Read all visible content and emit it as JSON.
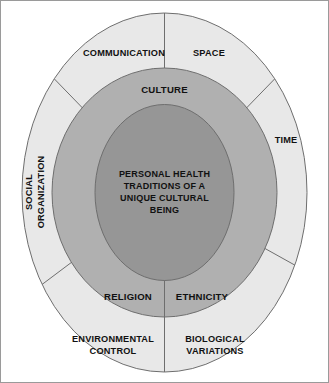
{
  "diagram": {
    "title": "Personal Health Traditions of a Unique Cultural Being",
    "type": "concentric-ellipse-model",
    "colors": {
      "background": "#ffffff",
      "outer_ring": "#e8e8e8",
      "middle_ring": "#b0b0b0",
      "inner_core": "#969696",
      "stroke": "#6e6e6e",
      "text": "#111111",
      "frame": "#9a9a9a"
    },
    "core": {
      "name": "core-ellipse",
      "lines": [
        "PERSONAL HEALTH",
        "TRADITIONS OF A",
        "UNIQUE CULTURAL",
        "BEING"
      ]
    },
    "middle_ring": {
      "name": "middle-ring",
      "labels": [
        {
          "id": "culture",
          "text": "CULTURE",
          "position": "top"
        },
        {
          "id": "religion",
          "text": "RELIGION",
          "position": "bottom-left"
        },
        {
          "id": "ethnicity",
          "text": "ETHNICITY",
          "position": "bottom-right"
        }
      ]
    },
    "outer_ring": {
      "name": "outer-ring",
      "labels": [
        {
          "id": "communication",
          "text": "COMMUNICATION",
          "lines": [
            "COMMUNICATION"
          ],
          "position": "top-left",
          "rotated": false
        },
        {
          "id": "space",
          "text": "SPACE",
          "lines": [
            "SPACE"
          ],
          "position": "top-right",
          "rotated": false
        },
        {
          "id": "time",
          "text": "TIME",
          "lines": [
            "TIME"
          ],
          "position": "right",
          "rotated": false
        },
        {
          "id": "biological-variations",
          "text": "BIOLOGICAL VARIATIONS",
          "lines": [
            "BIOLOGICAL",
            "VARIATIONS"
          ],
          "position": "bottom-right",
          "rotated": false
        },
        {
          "id": "environmental-control",
          "text": "ENVIRONMENTAL CONTROL",
          "lines": [
            "ENVIRONMENTAL",
            "CONTROL"
          ],
          "position": "bottom-left",
          "rotated": false
        },
        {
          "id": "social-organization",
          "text": "SOCIAL ORGANIZATION",
          "lines": [
            "SOCIAL",
            "ORGANIZATION"
          ],
          "position": "left",
          "rotated": true
        }
      ]
    }
  }
}
